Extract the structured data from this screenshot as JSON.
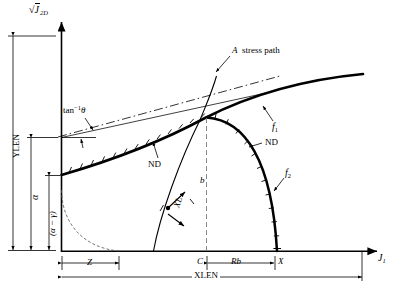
{
  "figure": {
    "type": "diagram",
    "background": "#ffffff",
    "line_color": "#000000"
  },
  "axes": {
    "y_axis_label": "J",
    "y_axis_label_sub": "2D",
    "y_axis_radical": "√",
    "x_axis_label": "J",
    "x_axis_label_sub": "1",
    "y_extent_label": "YLEN",
    "x_extent_label": "XLEN"
  },
  "curves": [
    {
      "name": "f1",
      "label": "f",
      "sub": "1",
      "style": "thick-hatched",
      "desc": "upper yield envelope with hatch ticks"
    },
    {
      "name": "f2",
      "label": "f",
      "sub": "2",
      "style": "thick-hatched",
      "desc": "elliptical cap with hatch ticks"
    },
    {
      "name": "stress_path",
      "label": "A  stress path",
      "style": "thin",
      "desc": "steep curve labelled A stress path"
    },
    {
      "name": "tangent",
      "label": "tan",
      "sup": "-1",
      "theta": "θ",
      "style": "dash-dot",
      "desc": "tangent line of slope tan^-1 theta"
    },
    {
      "name": "initial_cap",
      "label": "",
      "style": "thin-arc",
      "desc": "dashed quarter arc near origin"
    }
  ],
  "annotations": {
    "stress_path": "A  stress path",
    "tan_inverse": "tan",
    "tan_sup": "−1",
    "theta": "θ",
    "nd_left": "ND",
    "nd_right": "ND",
    "f1": "f",
    "f1_sub": "1",
    "f2": "f",
    "f2_sub": "2",
    "b": "b",
    "xl": "XL",
    "alpha": "α",
    "alpha_minus_gamma": "(α − γ)"
  },
  "dimensions": {
    "z": "Z",
    "c": "C",
    "rb": "Rb",
    "x": "X",
    "xlen": "XLEN",
    "ylen": "YLEN",
    "alpha": "α",
    "alpha_minus_gamma": "(α − γ)"
  }
}
